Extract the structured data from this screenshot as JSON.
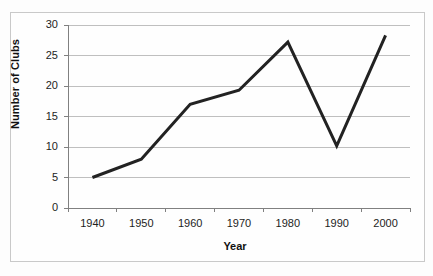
{
  "chart_data": {
    "type": "line",
    "title": "",
    "xlabel": "Year",
    "ylabel": "Number of Clubs",
    "categories": [
      "1940",
      "1950",
      "1960",
      "1970",
      "1980",
      "1990",
      "2000"
    ],
    "values": [
      5.0,
      8.0,
      17.0,
      19.3,
      27.2,
      10.2,
      28.3
    ],
    "series": [
      {
        "name": "Number of Clubs",
        "values": [
          5.0,
          8.0,
          17.0,
          19.3,
          27.2,
          10.2,
          28.3
        ]
      }
    ],
    "ylim": [
      0,
      30
    ],
    "yticks": [
      "0",
      "5",
      "10",
      "15",
      "20",
      "25",
      "30"
    ],
    "ytick_values": [
      0,
      5,
      10,
      15,
      20,
      25,
      30
    ],
    "grid": true,
    "grid_axis": "y",
    "legend": false,
    "legend_position": "none",
    "markers": false,
    "line_color": "#222222",
    "line_width": 3,
    "grid_color": "#bfbfbf",
    "axis_color": "#808080",
    "frame_color": "#c9c9c9",
    "background_color": "#fefefe",
    "text_color": "#1d1d1d"
  },
  "axes": {
    "y_title": "Number of Clubs",
    "x_title": "Year"
  }
}
